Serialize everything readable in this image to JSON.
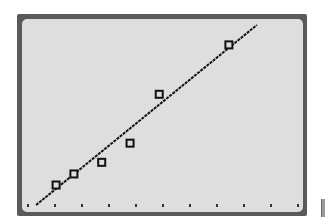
{
  "colors": {
    "frame": "#5a5a5a",
    "screen_background": "#dedede",
    "line": "#111111",
    "marker": "#111111",
    "tick": "#333333"
  },
  "chart_data": {
    "type": "scatter",
    "title": "",
    "xlabel": "",
    "ylabel": "",
    "grid": false,
    "legend": null,
    "marker": "hollow-square",
    "x_ticks_count": 11,
    "x_tick_labels": [],
    "y_tick_labels": [],
    "units_note": "values in screen tick units (1 unit = one x-tick spacing); no axis labels shown",
    "xlim": [
      0,
      10.3
    ],
    "ylim": [
      -0.3,
      7.1
    ],
    "series": [
      {
        "name": "data",
        "kind": "scatter",
        "x": [
          1.04,
          1.7,
          2.73,
          3.78,
          4.86,
          7.44
        ],
        "y": [
          0.74,
          1.15,
          1.58,
          2.29,
          4.1,
          5.93
        ]
      },
      {
        "name": "regression line",
        "kind": "line",
        "x": [
          0.3,
          8.48
        ],
        "y": [
          0.0,
          6.67
        ]
      }
    ]
  }
}
